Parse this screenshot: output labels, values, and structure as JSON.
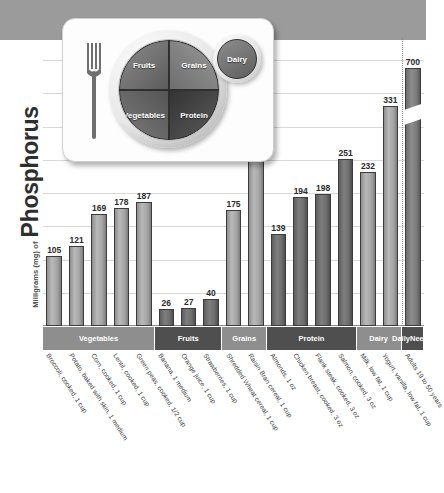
{
  "yaxis": {
    "prefix": "Milligrams (mg) of",
    "nutrient": "Phosphorus"
  },
  "plate": {
    "alt_name": "MyPlate graphic",
    "fruits": "Fruits",
    "grains": "Grains",
    "vegetables": "Vegetables",
    "protein": "Protein",
    "dairy": "Dairy"
  },
  "categories": [
    {
      "label": "Vegetables",
      "count": 5,
      "shade": "light"
    },
    {
      "label": "Fruits",
      "count": 3,
      "shade": "dark"
    },
    {
      "label": "Grains",
      "count": 2,
      "shade": "light"
    },
    {
      "label": "Protein",
      "count": 4,
      "shade": "dark"
    },
    {
      "label": "Dairy",
      "count": 2,
      "shade": "light"
    },
    {
      "label": "Daily\nNeeds",
      "count": 1,
      "shade": "dark"
    }
  ],
  "chart_data": {
    "type": "bar",
    "title": "Milligrams (mg) of Phosphorus",
    "xlabel": "",
    "ylabel": "Milligrams (mg) of Phosphorus",
    "ylim": [
      0,
      400
    ],
    "grid": true,
    "legend": "none",
    "axis_break": {
      "bar_index": 15,
      "note": "Daily Needs bar is truncated with a break slash; true value 700"
    },
    "categories": [
      "Broccoli, cooked, 1 cup",
      "Potato, baked with skin, 1 medium",
      "Corn, cooked, 1 cup",
      "Lentil, cooked, 1 cup",
      "Green peas, cooked, 1/2 cup",
      "Banana, 1 medium",
      "Orange juice, 1 cup",
      "Strawberries, 1 cup",
      "Shredded Wheat cereal, 1 cup",
      "Raisin Bran cereal, 1 cup",
      "Almonds, 1 oz",
      "Chicken breast, cooked, 3 oz",
      "Flank steak, cooked, 3 oz",
      "Salmon, cooked, 3 oz",
      "Milk, low fat, 1 cup",
      "Yogurt, vanilla, low fat, 1 cup",
      "Adults 19 to 50 years"
    ],
    "values": [
      105,
      121,
      169,
      178,
      187,
      26,
      27,
      40,
      175,
      259,
      139,
      194,
      198,
      251,
      232,
      331,
      700
    ]
  },
  "bars": [
    {
      "label": "Broccoli, cooked, 1 cup",
      "value": 105,
      "group": "Vegetables",
      "shade": "light"
    },
    {
      "label": "Potato, baked with skin, 1 medium",
      "value": 121,
      "group": "Vegetables",
      "shade": "light"
    },
    {
      "label": "Corn, cooked, 1 cup",
      "value": 169,
      "group": "Vegetables",
      "shade": "light"
    },
    {
      "label": "Lentil, cooked, 1 cup",
      "value": 178,
      "group": "Vegetables",
      "shade": "light"
    },
    {
      "label": "Green peas, cooked, 1/2 cup",
      "value": 187,
      "group": "Vegetables",
      "shade": "light"
    },
    {
      "label": "Banana, 1 medium",
      "value": 26,
      "group": "Fruits",
      "shade": "dark"
    },
    {
      "label": "Orange juice, 1 cup",
      "value": 27,
      "group": "Fruits",
      "shade": "dark"
    },
    {
      "label": "Strawberries, 1 cup",
      "value": 40,
      "group": "Fruits",
      "shade": "dark"
    },
    {
      "label": "Shredded Wheat cereal, 1 cup",
      "value": 175,
      "group": "Grains",
      "shade": "light"
    },
    {
      "label": "Raisin Bran cereal, 1 cup",
      "value": 259,
      "group": "Grains",
      "shade": "light"
    },
    {
      "label": "Almonds, 1 oz",
      "value": 139,
      "group": "Protein",
      "shade": "dark"
    },
    {
      "label": "Chicken breast, cooked, 3 oz",
      "value": 194,
      "group": "Protein",
      "shade": "dark"
    },
    {
      "label": "Flank steak, cooked, 3 oz",
      "value": 198,
      "group": "Protein",
      "shade": "dark"
    },
    {
      "label": "Salmon, cooked, 3 oz",
      "value": 251,
      "group": "Protein",
      "shade": "dark"
    },
    {
      "label": "Milk, low fat, 1 cup",
      "value": 232,
      "group": "Dairy",
      "shade": "light"
    },
    {
      "label": "Yogurt, vanilla, low fat, 1 cup",
      "value": 331,
      "group": "Dairy",
      "shade": "light"
    },
    {
      "label": "Adults 19 to 50 years",
      "value": 700,
      "group": "Daily Needs",
      "shade": "needs"
    }
  ]
}
